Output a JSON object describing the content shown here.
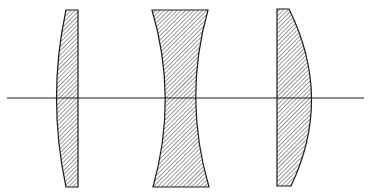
{
  "diagram": {
    "colors": {
      "stroke": "#1a1a1a",
      "hatch": "#333333",
      "background": "#ffffff"
    },
    "optical_axis": {
      "x1": 7,
      "x2": 364,
      "y": 98
    },
    "lenses": [
      {
        "name": "plano-convex-left",
        "type": "plano-convex (convex side left)"
      },
      {
        "name": "biconcave",
        "type": "biconcave"
      },
      {
        "name": "plano-convex-right",
        "type": "plano-convex (convex side right)"
      }
    ]
  }
}
